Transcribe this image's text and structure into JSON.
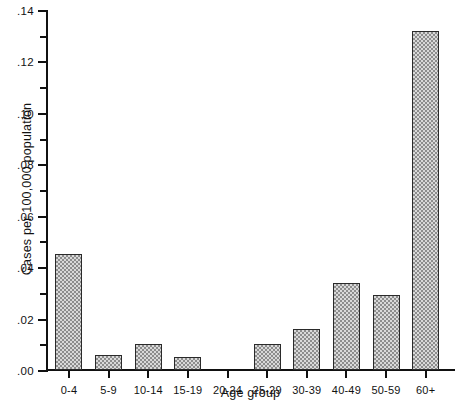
{
  "chart_data": {
    "type": "bar",
    "title": "",
    "xlabel": "Age group",
    "ylabel": "Cases per 100,000 population",
    "categories": [
      "0-4",
      "5-9",
      "10-14",
      "15-19",
      "20-24",
      "25-29",
      "30-39",
      "40-49",
      "50-59",
      "60+"
    ],
    "values": [
      0.045,
      0.006,
      0.01,
      0.005,
      0.0,
      0.01,
      0.016,
      0.034,
      0.029,
      0.132
    ],
    "ylim": [
      0,
      0.14
    ],
    "xlim_note": "categorical",
    "y_tick_values": [
      0.0,
      0.02,
      0.04,
      0.06,
      0.08,
      0.1,
      0.12,
      0.14
    ],
    "y_tick_labels": [
      ".00",
      ".02",
      ".04",
      ".06",
      ".08",
      ".10",
      ".12",
      ".14"
    ],
    "y_minor_tick_values": [
      0.01,
      0.03,
      0.05,
      0.07,
      0.09,
      0.11,
      0.13
    ],
    "grid": false,
    "legend": null,
    "legend_position": "none",
    "bar_fill": "#d9d9d9",
    "bar_pattern": "checkerboard-stipple",
    "bar_edge_color": "#2a2a2a",
    "axis_color": "#111111"
  }
}
